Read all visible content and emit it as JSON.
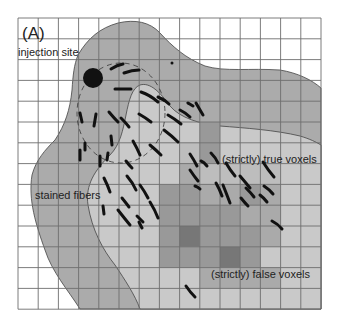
{
  "figure": {
    "panel_label": "(A)",
    "labels": {
      "injection_site": "injection site",
      "stained_fibers": "stained fibers",
      "true_voxels": "(strictly) true voxels",
      "false_voxels": "(strictly) false voxels"
    },
    "grid": {
      "columns": 15,
      "rows": 14,
      "x0": 18,
      "y0": 18,
      "cell_w": 20.2,
      "cell_h": 20.8
    },
    "colors": {
      "background": "#ffffff",
      "grid_line": "#6e6e6e",
      "outer_region": "#ababab",
      "inner_region": "#c9c9c9",
      "fiber_stroke": "#111111",
      "injection_dot": "#111111",
      "voxel_light": "#bdbdbd",
      "voxel_medlight": "#aaaaaa",
      "voxel_medium": "#999999",
      "voxel_dark": "#777777"
    },
    "voxels": [
      {
        "row": 5,
        "col": 9,
        "shade": "medium"
      },
      {
        "row": 6,
        "col": 8,
        "shade": "light"
      },
      {
        "row": 6,
        "col": 9,
        "shade": "medium"
      },
      {
        "row": 7,
        "col": 8,
        "shade": "medlight"
      },
      {
        "row": 7,
        "col": 9,
        "shade": "light"
      },
      {
        "row": 7,
        "col": 10,
        "shade": "light"
      },
      {
        "row": 7,
        "col": 11,
        "shade": "light"
      },
      {
        "row": 7,
        "col": 12,
        "shade": "light"
      },
      {
        "row": 8,
        "col": 7,
        "shade": "medium"
      },
      {
        "row": 8,
        "col": 8,
        "shade": "medium"
      },
      {
        "row": 8,
        "col": 9,
        "shade": "medlight"
      },
      {
        "row": 8,
        "col": 10,
        "shade": "medlight"
      },
      {
        "row": 8,
        "col": 11,
        "shade": "medium"
      },
      {
        "row": 8,
        "col": 12,
        "shade": "medlight"
      },
      {
        "row": 9,
        "col": 7,
        "shade": "medium"
      },
      {
        "row": 9,
        "col": 8,
        "shade": "medium"
      },
      {
        "row": 9,
        "col": 9,
        "shade": "medium"
      },
      {
        "row": 9,
        "col": 10,
        "shade": "medium"
      },
      {
        "row": 9,
        "col": 11,
        "shade": "medlight"
      },
      {
        "row": 9,
        "col": 12,
        "shade": "medlight"
      },
      {
        "row": 10,
        "col": 7,
        "shade": "medium"
      },
      {
        "row": 10,
        "col": 8,
        "shade": "dark"
      },
      {
        "row": 10,
        "col": 9,
        "shade": "medium"
      },
      {
        "row": 10,
        "col": 10,
        "shade": "medium"
      },
      {
        "row": 10,
        "col": 11,
        "shade": "medium"
      },
      {
        "row": 10,
        "col": 12,
        "shade": "medlight"
      },
      {
        "row": 11,
        "col": 7,
        "shade": "medium"
      },
      {
        "row": 11,
        "col": 8,
        "shade": "medium"
      },
      {
        "row": 11,
        "col": 9,
        "shade": "medium"
      },
      {
        "row": 11,
        "col": 10,
        "shade": "dark"
      },
      {
        "row": 11,
        "col": 11,
        "shade": "medium"
      },
      {
        "row": 12,
        "col": 9,
        "shade": "medlight"
      },
      {
        "row": 12,
        "col": 10,
        "shade": "medlight"
      },
      {
        "row": 12,
        "col": 11,
        "shade": "medlight"
      },
      {
        "row": 12,
        "col": 12,
        "shade": "medlight"
      }
    ]
  }
}
